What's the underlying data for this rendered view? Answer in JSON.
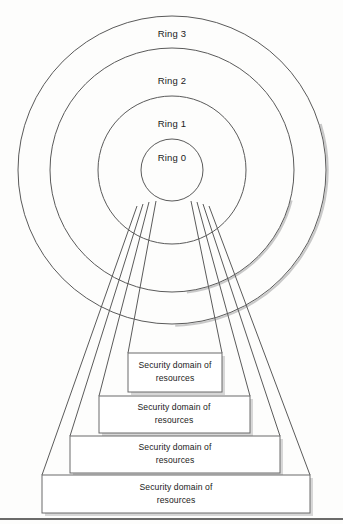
{
  "diagram": {
    "type": "concentric-ring-security-domain-diagram",
    "background_color": "#fdfdfc",
    "stroke_color": "#5a5a5a",
    "text_color": "#1b1b1b",
    "width": 343,
    "height": 524
  },
  "rings": {
    "center": {
      "x": 172,
      "y": 170
    },
    "items": [
      {
        "id": "ring-3",
        "label": "Ring 3",
        "radius": 154,
        "label_x": 172,
        "label_y": 28
      },
      {
        "id": "ring-2",
        "label": "Ring 2",
        "radius": 122,
        "label_x": 172,
        "label_y": 75
      },
      {
        "id": "ring-1",
        "label": "Ring 1",
        "radius": 74,
        "label_x": 172,
        "label_y": 118
      },
      {
        "id": "ring-0",
        "label": "Ring 0",
        "radius": 31,
        "label_x": 172,
        "label_y": 152
      }
    ]
  },
  "domains": {
    "label_line1": "Security domain of",
    "label_line2": "resources",
    "boxes": [
      {
        "id": "domain-box-1",
        "x": 128,
        "y": 353,
        "width": 94,
        "height": 39,
        "center_x": 175,
        "center_y": 372
      },
      {
        "id": "domain-box-2",
        "x": 99,
        "y": 396,
        "width": 151,
        "height": 37,
        "center_x": 174,
        "center_y": 414
      },
      {
        "id": "domain-box-3",
        "x": 70,
        "y": 436,
        "width": 210,
        "height": 37,
        "center_x": 175,
        "center_y": 454
      },
      {
        "id": "domain-box-4",
        "x": 42,
        "y": 475,
        "width": 268,
        "height": 38,
        "center_x": 176,
        "center_y": 494
      }
    ]
  },
  "funnels": [
    {
      "id": "funnel-1",
      "top_left_x": 156,
      "top_left_y": 201,
      "top_right_x": 191,
      "top_right_y": 201,
      "bottom_left_x": 128,
      "bottom_left_y": 353,
      "bottom_right_x": 222,
      "bottom_right_y": 353
    },
    {
      "id": "funnel-2",
      "top_left_x": 149,
      "top_left_y": 202,
      "top_right_x": 197,
      "top_right_y": 202,
      "bottom_left_x": 99,
      "bottom_left_y": 396,
      "bottom_right_x": 250,
      "bottom_right_y": 396
    },
    {
      "id": "funnel-3",
      "top_left_x": 143,
      "top_left_y": 204,
      "top_right_x": 203,
      "top_right_y": 204,
      "bottom_left_x": 70,
      "bottom_left_y": 436,
      "bottom_right_x": 280,
      "bottom_right_y": 436
    },
    {
      "id": "funnel-4",
      "top_left_x": 137,
      "top_left_y": 206,
      "top_right_x": 209,
      "top_right_y": 206,
      "bottom_left_x": 42,
      "bottom_left_y": 475,
      "bottom_right_x": 310,
      "bottom_right_y": 475
    }
  ],
  "footer_rule": {
    "x1": 0,
    "y1": 519,
    "x2": 343,
    "y2": 519
  }
}
